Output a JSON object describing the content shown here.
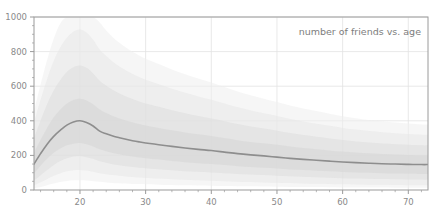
{
  "chart_data": {
    "type": "area",
    "title": "number of friends vs. age",
    "xlabel": "",
    "ylabel": "",
    "xlim": [
      13,
      73
    ],
    "ylim": [
      0,
      1000
    ],
    "grid": true,
    "legend_position": "none",
    "x_ticks": [
      20,
      30,
      40,
      50,
      60,
      70
    ],
    "x_tick_labels": [
      "20",
      "30",
      "40",
      "50",
      "60",
      "70"
    ],
    "x_minor_step": 2,
    "y_ticks": [
      0,
      200,
      400,
      600,
      800,
      1000
    ],
    "y_tick_labels": [
      "0",
      "200",
      "400",
      "600",
      "800",
      "1000"
    ],
    "y_minor_step": 50,
    "x": [
      13,
      14,
      15,
      16,
      17,
      18,
      19,
      20,
      21,
      22,
      23,
      24,
      25,
      26,
      27,
      28,
      29,
      30,
      32,
      34,
      36,
      38,
      40,
      42,
      44,
      46,
      48,
      50,
      52,
      54,
      56,
      58,
      60,
      62,
      64,
      66,
      68,
      70,
      72,
      73
    ],
    "series": [
      {
        "name": "median",
        "role": "center-line",
        "color": "#8e8e8e",
        "values": [
          150,
          210,
          265,
          310,
          345,
          375,
          393,
          400,
          390,
          370,
          340,
          325,
          312,
          302,
          293,
          285,
          278,
          272,
          262,
          252,
          243,
          235,
          228,
          219,
          210,
          203,
          197,
          190,
          183,
          177,
          172,
          167,
          162,
          158,
          155,
          152,
          150,
          148,
          147,
          147
        ]
      },
      {
        "name": "band-inner",
        "role": "band",
        "color": "#d6d6d6",
        "opacity": 0.55,
        "lower": [
          95,
          140,
          180,
          215,
          240,
          258,
          268,
          272,
          265,
          252,
          235,
          224,
          214,
          206,
          199,
          193,
          188,
          184,
          176,
          168,
          161,
          155,
          150,
          144,
          138,
          133,
          128,
          124,
          119,
          115,
          111,
          108,
          104,
          101,
          99,
          97,
          95,
          94,
          93,
          93
        ],
        "upper": [
          215,
          290,
          360,
          420,
          465,
          500,
          520,
          528,
          518,
          495,
          465,
          445,
          428,
          414,
          402,
          391,
          381,
          373,
          359,
          345,
          333,
          322,
          312,
          300,
          288,
          278,
          270,
          261,
          251,
          243,
          236,
          229,
          222,
          217,
          212,
          208,
          205,
          203,
          201,
          201
        ]
      },
      {
        "name": "band-mid",
        "role": "band",
        "color": "#dcdcdc",
        "opacity": 0.5,
        "lower": [
          55,
          85,
          115,
          145,
          168,
          184,
          193,
          196,
          190,
          180,
          166,
          157,
          149,
          143,
          137,
          133,
          129,
          126,
          120,
          114,
          109,
          105,
          101,
          97,
          93,
          89,
          86,
          83,
          79,
          76,
          73,
          71,
          68,
          66,
          65,
          63,
          62,
          61,
          60,
          60
        ],
        "upper": [
          300,
          400,
          495,
          575,
          635,
          682,
          710,
          720,
          706,
          674,
          632,
          603,
          578,
          558,
          541,
          526,
          512,
          500,
          481,
          461,
          444,
          428,
          414,
          398,
          381,
          367,
          355,
          343,
          329,
          318,
          308,
          298,
          289,
          281,
          275,
          269,
          265,
          261,
          258,
          258
        ]
      },
      {
        "name": "band-outer",
        "role": "band",
        "color": "#e6e6e6",
        "opacity": 0.5,
        "lower": [
          28,
          45,
          64,
          82,
          97,
          108,
          114,
          116,
          112,
          106,
          97,
          91,
          86,
          82,
          78,
          75,
          72,
          70,
          66,
          62,
          59,
          56,
          53,
          50,
          48,
          46,
          44,
          42,
          40,
          38,
          36,
          35,
          33,
          32,
          31,
          30,
          29,
          28,
          28,
          28
        ],
        "upper": [
          390,
          520,
          640,
          745,
          823,
          880,
          915,
          928,
          910,
          868,
          812,
          774,
          741,
          714,
          691,
          671,
          653,
          637,
          611,
          585,
          562,
          541,
          522,
          500,
          478,
          460,
          444,
          428,
          411,
          396,
          383,
          371,
          359,
          349,
          341,
          334,
          328,
          323,
          319,
          319
        ]
      },
      {
        "name": "band-extreme",
        "role": "band",
        "color": "#efefef",
        "opacity": 0.55,
        "lower": [
          10,
          18,
          28,
          38,
          46,
          52,
          56,
          57,
          55,
          51,
          47,
          44,
          41,
          39,
          37,
          35,
          34,
          33,
          31,
          29,
          27,
          26,
          25,
          23,
          22,
          21,
          20,
          19,
          18,
          17,
          17,
          16,
          15,
          15,
          14,
          14,
          13,
          13,
          13,
          13
        ],
        "upper": [
          455,
          610,
          752,
          874,
          963,
          1000,
          1000,
          1000,
          1000,
          1000,
          968,
          922,
          883,
          851,
          823,
          799,
          778,
          759,
          728,
          697,
          669,
          644,
          621,
          595,
          569,
          547,
          528,
          509,
          489,
          471,
          456,
          441,
          427,
          415,
          405,
          397,
          390,
          384,
          379,
          379
        ]
      }
    ]
  },
  "plot_geometry": {
    "left": 34,
    "right": 428,
    "top": 17,
    "bottom": 190
  },
  "colors": {
    "axis": "#9a9a9a",
    "grid": "#e2e2e2",
    "median_line": "#8e8e8e",
    "tick_text": "#8a8a8a",
    "title_text": "#7d7d7d",
    "background": "#ffffff"
  }
}
